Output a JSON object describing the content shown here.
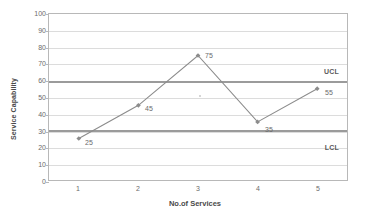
{
  "chart_data": {
    "type": "line",
    "title": "",
    "xlabel": "No.of Services",
    "ylabel": "Service Capability",
    "categories": [
      "1",
      "2",
      "3",
      "4",
      "5"
    ],
    "values": [
      25,
      45,
      75,
      35,
      55
    ],
    "point_labels": [
      "25",
      "45",
      "75",
      "35",
      "55"
    ],
    "ylim": [
      0,
      100
    ],
    "ytick_step": 10,
    "ytick_labels": [
      "100",
      "90",
      "80",
      "70",
      "60",
      "50",
      "40",
      "30",
      "20",
      "10",
      "0"
    ],
    "ytick_values": [
      100,
      90,
      80,
      70,
      60,
      50,
      40,
      30,
      20,
      10,
      0
    ],
    "xtick_labels": [
      "1",
      "2",
      "3",
      "4",
      "5"
    ],
    "grid": true,
    "legend": "none",
    "series": [
      {
        "name": "Service Capability",
        "values": [
          25,
          45,
          75,
          35,
          55
        ],
        "color": "#8c8c8c",
        "marker": "diamond"
      }
    ],
    "control_limits": [
      {
        "name": "UCL",
        "label": "UCL",
        "value": 60,
        "color": "#9b9b9b",
        "label_position": "above-right"
      },
      {
        "name": "LCL",
        "label": "LCL",
        "value": 31,
        "color": "#9b9b9b",
        "label_position": "below-right"
      }
    ],
    "colors": {
      "series_line": "#8c8c8c",
      "gridline": "#dcdcdc",
      "axis": "#b8b8b8",
      "limit_line": "#9b9b9b",
      "text": "#6b6b6b",
      "background": "#ffffff"
    }
  }
}
